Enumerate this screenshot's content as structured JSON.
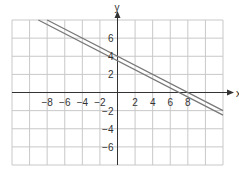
{
  "chart_data": {
    "type": "line",
    "title": "",
    "xlabel": "x",
    "ylabel": "y",
    "xlim": [
      -12,
      12
    ],
    "ylim": [
      -8,
      8
    ],
    "grid": true,
    "grid_step": 2,
    "x_tick_labels": [
      "−8",
      "−6",
      "−4",
      "−2",
      "2",
      "4",
      "6",
      "8"
    ],
    "x_ticks": [
      -8,
      -6,
      -4,
      -2,
      2,
      4,
      6,
      8
    ],
    "y_tick_labels": [
      "6",
      "4",
      "2",
      "−2",
      "−4",
      "−6"
    ],
    "y_ticks": [
      6,
      4,
      2,
      -2,
      -4,
      -6
    ],
    "series": [
      {
        "name": "line 1",
        "equation": "y = -x/2 + 4",
        "slope": -0.5,
        "intercept": 4,
        "x": [
          -8,
          12
        ],
        "y": [
          8,
          -2
        ]
      },
      {
        "name": "line 2",
        "equation": "y = -x/2 + 3.5",
        "slope": -0.5,
        "intercept": 3.5,
        "x": [
          -9,
          12
        ],
        "y": [
          8,
          -2.5
        ]
      }
    ],
    "colors": {
      "grid": "#c8c8c8",
      "axis": "#333333",
      "line": "#777777"
    }
  }
}
